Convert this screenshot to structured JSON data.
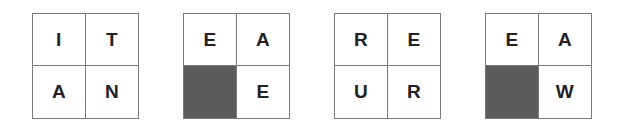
{
  "puzzle": {
    "colors": {
      "border": "#7a7a7a",
      "shaded": "#5b5b5b",
      "letter": "#222222",
      "cell_bg": "#ffffff"
    },
    "grids": [
      {
        "cells": [
          {
            "letter": "I",
            "shaded": false
          },
          {
            "letter": "T",
            "shaded": false
          },
          {
            "letter": "A",
            "shaded": false
          },
          {
            "letter": "N",
            "shaded": false
          }
        ]
      },
      {
        "cells": [
          {
            "letter": "E",
            "shaded": false
          },
          {
            "letter": "A",
            "shaded": false
          },
          {
            "letter": "",
            "shaded": true
          },
          {
            "letter": "E",
            "shaded": false
          }
        ]
      },
      {
        "cells": [
          {
            "letter": "R",
            "shaded": false
          },
          {
            "letter": "E",
            "shaded": false
          },
          {
            "letter": "U",
            "shaded": false
          },
          {
            "letter": "R",
            "shaded": false
          }
        ]
      },
      {
        "cells": [
          {
            "letter": "E",
            "shaded": false
          },
          {
            "letter": "A",
            "shaded": false
          },
          {
            "letter": "",
            "shaded": true
          },
          {
            "letter": "W",
            "shaded": false
          }
        ]
      }
    ]
  }
}
